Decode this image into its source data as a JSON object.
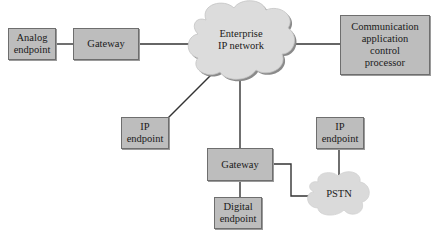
{
  "diagram": {
    "nodes": {
      "analog_endpoint": {
        "label": "Analog endpoint",
        "line1": "Analog",
        "line2": "endpoint"
      },
      "gateway_top": {
        "label": "Gateway"
      },
      "enterprise_network": {
        "label": "Enterprise IP network",
        "line1": "Enterprise",
        "line2": "IP network"
      },
      "cacp": {
        "label": "Communication application control processor",
        "line1": "Communication",
        "line2": "application",
        "line3": "control",
        "line4": "processor"
      },
      "ip_endpoint_left": {
        "label": "IP endpoint",
        "line1": "IP",
        "line2": "endpoint"
      },
      "gateway_bottom": {
        "label": "Gateway"
      },
      "digital_endpoint": {
        "label": "Digital endpoint",
        "line1": "Digital",
        "line2": "endpoint"
      },
      "ip_endpoint_right": {
        "label": "IP endpoint",
        "line1": "IP",
        "line2": "endpoint"
      },
      "pstn": {
        "label": "PSTN"
      }
    },
    "edges": [
      [
        "analog_endpoint",
        "gateway_top"
      ],
      [
        "gateway_top",
        "enterprise_network"
      ],
      [
        "enterprise_network",
        "cacp"
      ],
      [
        "enterprise_network",
        "ip_endpoint_left"
      ],
      [
        "enterprise_network",
        "gateway_bottom"
      ],
      [
        "gateway_bottom",
        "digital_endpoint"
      ],
      [
        "gateway_bottom",
        "pstn"
      ],
      [
        "ip_endpoint_right",
        "pstn"
      ]
    ],
    "colors": {
      "box_fill": "#bdbdbd",
      "cloud_fill": "#dcdcdc",
      "line": "#333333"
    }
  }
}
